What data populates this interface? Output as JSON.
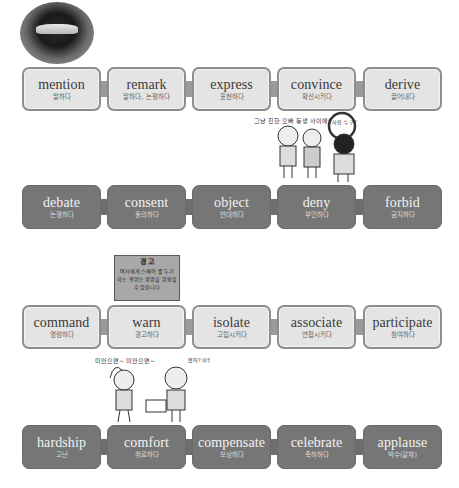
{
  "rows": [
    {
      "style": "light",
      "cards": [
        {
          "en": "mention",
          "ko": "말하다"
        },
        {
          "en": "remark",
          "ko": "말하다, 논평하다"
        },
        {
          "en": "express",
          "ko": "표현하다"
        },
        {
          "en": "convince",
          "ko": "확신시키다"
        },
        {
          "en": "derive",
          "ko": "끌어내다"
        }
      ]
    },
    {
      "style": "dark",
      "cards": [
        {
          "en": "debate",
          "ko": "논쟁하다"
        },
        {
          "en": "consent",
          "ko": "동의하다"
        },
        {
          "en": "object",
          "ko": "반대하다"
        },
        {
          "en": "deny",
          "ko": "부인하다"
        },
        {
          "en": "forbid",
          "ko": "금지하다"
        }
      ]
    },
    {
      "style": "light",
      "cards": [
        {
          "en": "command",
          "ko": "명령하다"
        },
        {
          "en": "warn",
          "ko": "경고하다"
        },
        {
          "en": "isolate",
          "ko": "고립시키다"
        },
        {
          "en": "associate",
          "ko": "연합시키다"
        },
        {
          "en": "participate",
          "ko": "참여하다"
        }
      ]
    },
    {
      "style": "dark",
      "cards": [
        {
          "en": "hardship",
          "ko": "고난"
        },
        {
          "en": "comfort",
          "ko": "위로하다"
        },
        {
          "en": "compensate",
          "ko": "보상하다"
        },
        {
          "en": "celebrate",
          "ko": "축하하다"
        },
        {
          "en": "applause",
          "ko": "박수(갈채)"
        }
      ]
    }
  ],
  "illustrations": {
    "lips": {
      "icon": "lips-photo"
    },
    "warning_sign": {
      "title": "경 고",
      "lines": [
        "여자에게 스페어 를 두기",
        "하는 행위는 생명을 위협할",
        "수 있습니다"
      ]
    },
    "cartoon_top": {
      "caption": "그냥 친한 오빠 동생 사이에요~",
      "bubble": "그사람 누구?"
    },
    "cartoon_bottom": {
      "caption": "미안으면~ 미안으면~",
      "bubble": "봤어? 미워.."
    }
  }
}
